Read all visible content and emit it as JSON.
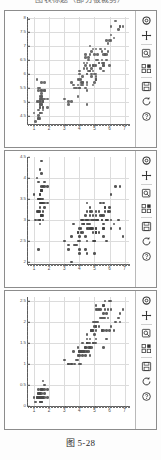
{
  "page": {
    "clipped_header_text": "图表标题（部分被裁剪）",
    "caption": "图 5-28"
  },
  "toolbar": {
    "buttons": [
      {
        "name": "home-icon",
        "label": "Home",
        "glyph": "home"
      },
      {
        "name": "move-icon",
        "label": "Pan/Zoom",
        "glyph": "move"
      },
      {
        "name": "zoom-rect-icon",
        "label": "Zoom to rectangle",
        "glyph": "zoom"
      },
      {
        "name": "subplots-icon",
        "label": "Configure subplots",
        "glyph": "subplots"
      },
      {
        "name": "save-icon",
        "label": "Save the figure",
        "glyph": "save"
      },
      {
        "name": "back-icon",
        "label": "Back to previous view",
        "glyph": "back"
      },
      {
        "name": "help-icon",
        "label": "Help",
        "glyph": "help"
      }
    ]
  },
  "chart_data": [
    {
      "type": "scatter",
      "title": "",
      "xlabel": "",
      "ylabel": "",
      "xlim": [
        0.6,
        7.3
      ],
      "ylim": [
        4.2,
        8.05
      ],
      "xticks": [
        1,
        2,
        3,
        4,
        5,
        6,
        7
      ],
      "yticks": [
        4.5,
        5,
        5.5,
        6,
        6.5,
        7,
        7.5,
        8
      ],
      "grid": true,
      "marker_color": "#5a5a5a",
      "x": [
        1.4,
        1.4,
        1.3,
        1.5,
        1.4,
        1.7,
        1.4,
        1.5,
        1.4,
        1.5,
        1.5,
        1.6,
        1.4,
        1.1,
        1.2,
        1.5,
        1.3,
        1.4,
        1.7,
        1.5,
        1.7,
        1.5,
        1.0,
        1.7,
        1.9,
        1.6,
        1.6,
        1.5,
        1.4,
        1.6,
        1.6,
        1.5,
        1.5,
        1.4,
        1.5,
        1.2,
        1.3,
        1.4,
        1.3,
        1.5,
        1.3,
        1.3,
        1.3,
        1.6,
        1.9,
        1.4,
        1.6,
        1.4,
        1.5,
        1.4,
        4.7,
        4.5,
        4.9,
        4.0,
        4.6,
        4.5,
        4.7,
        3.3,
        4.6,
        3.9,
        3.5,
        4.2,
        4.0,
        4.7,
        3.6,
        4.4,
        4.5,
        4.1,
        4.5,
        3.9,
        4.8,
        4.0,
        4.9,
        4.7,
        4.3,
        4.4,
        4.8,
        5.0,
        4.5,
        3.5,
        3.8,
        3.7,
        3.9,
        5.1,
        4.5,
        4.5,
        4.7,
        4.4,
        4.1,
        4.0,
        4.4,
        4.6,
        4.0,
        3.3,
        4.2,
        4.2,
        4.2,
        4.3,
        3.0,
        4.1,
        6.0,
        5.1,
        5.9,
        5.6,
        5.8,
        6.6,
        4.5,
        6.3,
        5.8,
        6.1,
        5.1,
        5.3,
        5.5,
        5.0,
        5.1,
        5.3,
        5.5,
        6.7,
        6.9,
        5.0,
        5.7,
        4.9,
        6.7,
        4.9,
        5.7,
        6.0,
        4.8,
        4.9,
        5.6,
        5.8,
        6.1,
        6.4,
        5.6,
        5.1,
        5.6,
        6.1,
        5.6,
        5.5,
        4.8,
        5.4,
        5.6,
        5.1,
        5.1,
        5.9,
        5.7,
        5.2,
        5.0,
        5.2,
        5.4,
        5.1
      ],
      "y": [
        5.1,
        4.9,
        4.7,
        4.6,
        5.0,
        5.4,
        4.6,
        5.0,
        4.4,
        4.9,
        5.4,
        4.8,
        4.8,
        4.3,
        5.8,
        5.7,
        5.4,
        5.1,
        5.7,
        5.1,
        5.4,
        5.1,
        4.6,
        5.1,
        4.8,
        5.0,
        5.0,
        5.2,
        5.2,
        4.7,
        4.8,
        5.4,
        5.2,
        5.5,
        4.9,
        5.0,
        5.5,
        4.9,
        4.4,
        5.1,
        5.0,
        4.5,
        4.4,
        5.0,
        5.1,
        4.8,
        5.1,
        4.6,
        5.3,
        5.0,
        7.0,
        6.4,
        6.9,
        5.5,
        6.5,
        5.7,
        6.3,
        4.9,
        6.6,
        5.2,
        5.0,
        5.9,
        6.0,
        6.1,
        5.6,
        6.7,
        5.6,
        5.8,
        6.2,
        5.6,
        5.9,
        6.1,
        6.3,
        6.1,
        6.4,
        6.6,
        6.8,
        6.7,
        6.0,
        5.7,
        5.5,
        5.5,
        5.8,
        6.0,
        5.4,
        6.0,
        6.7,
        6.3,
        5.6,
        5.5,
        5.5,
        6.1,
        5.8,
        5.0,
        5.6,
        5.7,
        5.7,
        6.2,
        5.1,
        5.7,
        6.3,
        5.8,
        7.1,
        6.3,
        6.5,
        7.6,
        4.9,
        7.3,
        6.7,
        7.2,
        6.5,
        6.4,
        6.8,
        5.7,
        5.8,
        6.4,
        6.5,
        7.7,
        7.7,
        6.0,
        6.9,
        5.6,
        7.7,
        6.3,
        6.7,
        7.2,
        6.2,
        6.1,
        6.4,
        7.2,
        7.4,
        7.9,
        6.4,
        6.3,
        6.1,
        7.7,
        6.3,
        6.4,
        6.0,
        6.9,
        6.7,
        6.9,
        5.8,
        6.8,
        6.7,
        6.7,
        6.3,
        6.5,
        6.2,
        5.9
      ]
    },
    {
      "type": "scatter",
      "title": "",
      "xlabel": "",
      "ylabel": "",
      "xlim": [
        0.6,
        7.3
      ],
      "ylim": [
        1.95,
        4.5
      ],
      "xticks": [
        1,
        2,
        3,
        4,
        5,
        6,
        7
      ],
      "yticks": [
        2,
        2.5,
        3,
        3.5,
        4,
        4.5
      ],
      "grid": true,
      "marker_color": "#3f3f3f",
      "x": [
        1.4,
        1.4,
        1.3,
        1.5,
        1.4,
        1.7,
        1.4,
        1.5,
        1.4,
        1.5,
        1.5,
        1.6,
        1.4,
        1.1,
        1.2,
        1.5,
        1.3,
        1.4,
        1.7,
        1.5,
        1.7,
        1.5,
        1.0,
        1.7,
        1.9,
        1.6,
        1.6,
        1.5,
        1.4,
        1.6,
        1.6,
        1.5,
        1.5,
        1.4,
        1.5,
        1.2,
        1.3,
        1.4,
        1.3,
        1.5,
        1.3,
        1.3,
        1.3,
        1.6,
        1.9,
        1.4,
        1.6,
        1.4,
        1.5,
        1.4,
        4.7,
        4.5,
        4.9,
        4.0,
        4.6,
        4.5,
        4.7,
        3.3,
        4.6,
        3.9,
        3.5,
        4.2,
        4.0,
        4.7,
        3.6,
        4.4,
        4.5,
        4.1,
        4.5,
        3.9,
        4.8,
        4.0,
        4.9,
        4.7,
        4.3,
        4.4,
        4.8,
        5.0,
        4.5,
        3.5,
        3.8,
        3.7,
        3.9,
        5.1,
        4.5,
        4.5,
        4.7,
        4.4,
        4.1,
        4.0,
        4.4,
        4.6,
        4.0,
        3.3,
        4.2,
        4.2,
        4.2,
        4.3,
        3.0,
        4.1,
        6.0,
        5.1,
        5.9,
        5.6,
        5.8,
        6.6,
        4.5,
        6.3,
        5.8,
        6.1,
        5.1,
        5.3,
        5.5,
        5.0,
        5.1,
        5.3,
        5.5,
        6.7,
        6.9,
        5.0,
        5.7,
        4.9,
        6.7,
        4.9,
        5.7,
        6.0,
        4.8,
        4.9,
        5.6,
        5.8,
        6.1,
        6.4,
        5.6,
        5.1,
        5.6,
        6.1,
        5.6,
        5.5,
        4.8,
        5.4,
        5.6,
        5.1,
        5.1,
        5.9,
        5.7,
        5.2,
        5.0,
        5.2,
        5.4,
        5.1
      ],
      "y": [
        3.5,
        3.0,
        3.2,
        3.1,
        3.6,
        3.9,
        3.4,
        3.4,
        2.9,
        3.1,
        3.7,
        3.4,
        3.0,
        3.0,
        4.0,
        4.4,
        3.9,
        3.5,
        3.8,
        3.8,
        3.4,
        3.7,
        3.6,
        3.3,
        3.4,
        3.0,
        3.4,
        3.5,
        3.4,
        3.2,
        3.1,
        3.4,
        4.1,
        4.2,
        3.1,
        3.2,
        3.5,
        3.6,
        3.0,
        3.4,
        3.5,
        2.3,
        3.2,
        3.5,
        3.8,
        3.0,
        3.8,
        3.2,
        3.7,
        3.3,
        3.2,
        3.2,
        3.1,
        2.3,
        2.8,
        2.8,
        3.3,
        2.4,
        2.9,
        2.7,
        2.0,
        3.0,
        2.2,
        2.9,
        2.9,
        3.1,
        3.0,
        2.7,
        2.2,
        2.5,
        3.2,
        2.8,
        2.5,
        2.8,
        2.9,
        3.0,
        2.8,
        3.0,
        2.9,
        2.6,
        2.4,
        2.4,
        2.7,
        2.7,
        3.0,
        3.4,
        3.1,
        2.3,
        3.0,
        2.5,
        2.6,
        3.0,
        2.6,
        2.3,
        2.7,
        3.0,
        2.9,
        2.9,
        2.5,
        2.8,
        3.3,
        2.7,
        3.0,
        2.9,
        3.0,
        3.0,
        2.5,
        2.9,
        2.5,
        3.6,
        3.2,
        2.7,
        3.0,
        2.5,
        2.8,
        3.2,
        3.0,
        3.8,
        2.6,
        2.2,
        3.2,
        2.8,
        2.8,
        2.7,
        3.3,
        3.2,
        2.8,
        3.0,
        2.8,
        3.0,
        2.8,
        3.8,
        2.8,
        2.8,
        2.6,
        3.0,
        3.4,
        3.1,
        3.0,
        3.1,
        3.1,
        3.1,
        2.7,
        3.2,
        3.3,
        3.0,
        2.5,
        3.0,
        3.4,
        3.0
      ]
    },
    {
      "type": "scatter",
      "title": "",
      "xlabel": "",
      "ylabel": "",
      "xlim": [
        0.6,
        7.3
      ],
      "ylim": [
        0.0,
        2.6
      ],
      "xticks": [
        1,
        2,
        3,
        4,
        5,
        6,
        7
      ],
      "yticks": [
        0,
        0.5,
        1,
        1.5,
        2,
        2.5
      ],
      "grid": true,
      "marker_color": "#4a4a4a",
      "x": [
        1.4,
        1.4,
        1.3,
        1.5,
        1.4,
        1.7,
        1.4,
        1.5,
        1.4,
        1.5,
        1.5,
        1.6,
        1.4,
        1.1,
        1.2,
        1.5,
        1.3,
        1.4,
        1.7,
        1.5,
        1.7,
        1.5,
        1.0,
        1.7,
        1.9,
        1.6,
        1.6,
        1.5,
        1.4,
        1.6,
        1.6,
        1.5,
        1.5,
        1.4,
        1.5,
        1.2,
        1.3,
        1.4,
        1.3,
        1.5,
        1.3,
        1.3,
        1.3,
        1.6,
        1.9,
        1.4,
        1.6,
        1.4,
        1.5,
        1.4,
        4.7,
        4.5,
        4.9,
        4.0,
        4.6,
        4.5,
        4.7,
        3.3,
        4.6,
        3.9,
        3.5,
        4.2,
        4.0,
        4.7,
        3.6,
        4.4,
        4.5,
        4.1,
        4.5,
        3.9,
        4.8,
        4.0,
        4.9,
        4.7,
        4.3,
        4.4,
        4.8,
        5.0,
        4.5,
        3.5,
        3.8,
        3.7,
        3.9,
        5.1,
        4.5,
        4.5,
        4.7,
        4.4,
        4.1,
        4.0,
        4.4,
        4.6,
        4.0,
        3.3,
        4.2,
        4.2,
        4.2,
        4.3,
        3.0,
        4.1,
        6.0,
        5.1,
        5.9,
        5.6,
        5.8,
        6.6,
        4.5,
        6.3,
        5.8,
        6.1,
        5.1,
        5.3,
        5.5,
        5.0,
        5.1,
        5.3,
        5.5,
        6.7,
        6.9,
        5.0,
        5.7,
        4.9,
        6.7,
        4.9,
        5.7,
        6.0,
        4.8,
        4.9,
        5.6,
        5.8,
        6.1,
        6.4,
        5.6,
        5.1,
        5.6,
        6.1,
        5.6,
        5.5,
        4.8,
        5.4,
        5.6,
        5.1,
        5.1,
        5.9,
        5.7,
        5.2,
        5.0,
        5.2,
        5.4,
        5.1
      ],
      "y": [
        0.2,
        0.2,
        0.2,
        0.2,
        0.2,
        0.4,
        0.3,
        0.2,
        0.2,
        0.1,
        0.2,
        0.2,
        0.1,
        0.1,
        0.2,
        0.4,
        0.4,
        0.3,
        0.3,
        0.3,
        0.2,
        0.4,
        0.2,
        0.5,
        0.2,
        0.2,
        0.4,
        0.2,
        0.2,
        0.2,
        0.2,
        0.4,
        0.1,
        0.2,
        0.2,
        0.2,
        0.2,
        0.1,
        0.2,
        0.2,
        0.3,
        0.3,
        0.2,
        0.6,
        0.4,
        0.3,
        0.2,
        0.2,
        0.2,
        0.2,
        1.4,
        1.5,
        1.5,
        1.3,
        1.5,
        1.3,
        1.6,
        1.0,
        1.3,
        1.4,
        1.0,
        1.5,
        1.0,
        1.4,
        1.3,
        1.4,
        1.5,
        1.0,
        1.5,
        1.1,
        1.8,
        1.3,
        1.5,
        1.2,
        1.3,
        1.4,
        1.4,
        1.7,
        1.5,
        1.0,
        1.1,
        1.0,
        1.2,
        1.6,
        1.5,
        1.6,
        1.5,
        1.3,
        1.3,
        1.3,
        1.2,
        1.4,
        1.2,
        1.0,
        1.3,
        1.2,
        1.3,
        1.3,
        1.1,
        1.3,
        2.5,
        1.9,
        2.1,
        1.8,
        2.2,
        2.1,
        1.7,
        1.8,
        1.8,
        2.5,
        2.0,
        1.9,
        2.1,
        2.0,
        2.4,
        2.3,
        1.8,
        2.2,
        2.3,
        1.5,
        2.3,
        2.0,
        2.0,
        1.8,
        2.1,
        1.8,
        1.8,
        1.8,
        2.1,
        1.6,
        1.9,
        2.0,
        2.2,
        1.5,
        1.4,
        2.3,
        2.4,
        1.8,
        1.8,
        2.1,
        2.4,
        2.3,
        1.9,
        2.3,
        2.5,
        2.3,
        1.9,
        2.0,
        2.3,
        1.8
      ]
    }
  ]
}
